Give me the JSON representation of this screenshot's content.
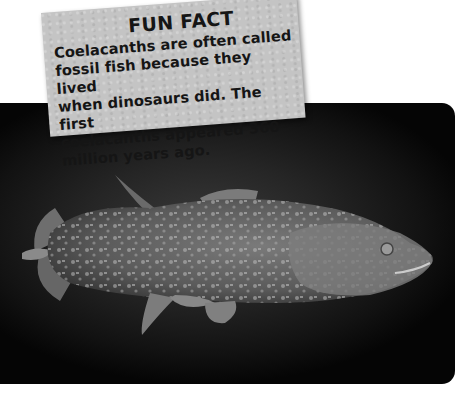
{
  "fun_fact": {
    "title": "FUN FACT",
    "lines": [
      "Coelacanths are often called",
      "fossil fish because they lived",
      "when dinosaurs did. The first",
      "coelacanths appeared 360",
      "million years ago."
    ]
  },
  "photo": {
    "subject": "coelacanth fish",
    "background_color": "#111111",
    "fish_color": "#6a6a6a",
    "spot_color": "#b5b5b5"
  }
}
